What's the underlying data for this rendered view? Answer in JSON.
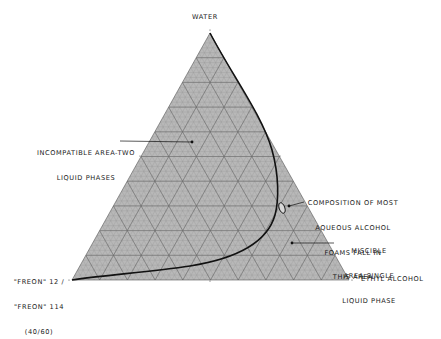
{
  "diagram": {
    "type": "ternary-phase-diagram",
    "vertices": {
      "top": "WATER",
      "bottom_right": "ETHYL ALCOHOL",
      "bottom_left": [
        "\"FREON\" 12 /",
        "\"FREON\" 114",
        "(40/60)"
      ]
    },
    "grid": {
      "major_step_percent": 10,
      "minor_step_percent": 2
    },
    "annotations": {
      "incompatible": [
        "INCOMPATIBLE AREA-TWO",
        "LIQUID PHASES"
      ],
      "foams": [
        "COMPOSITION OF MOST",
        "AQUEOUS ALCOHOL",
        "FOAMS FALL IN",
        "THIS AREA"
      ],
      "miscible": [
        "MISCIBLE",
        "AREA-SINGLE",
        "LIQUID PHASE"
      ]
    },
    "colors": {
      "fill": "#b8b8b8",
      "major_grid": "#6a6a6a",
      "minor_grid": "#9a9a9a",
      "curve": "#111111",
      "text": "#1a1a1a"
    }
  }
}
